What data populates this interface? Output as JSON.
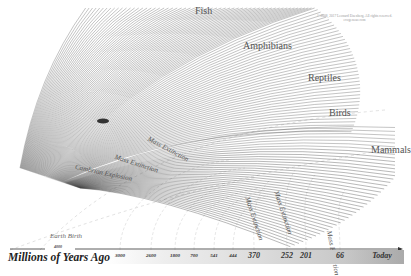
{
  "diagram": {
    "type": "evolutionary-tree-fan",
    "groups": [
      {
        "label": "Fish",
        "x": 195,
        "y": 5
      },
      {
        "label": "Amphibians",
        "x": 243,
        "y": 40
      },
      {
        "label": "Reptiles",
        "x": 308,
        "y": 72
      },
      {
        "label": "Birds",
        "x": 329,
        "y": 107
      },
      {
        "label": "Mammals",
        "x": 371,
        "y": 144
      }
    ],
    "annotations": [
      {
        "label": "Mass Extinction",
        "x": 150,
        "y": 135,
        "rot": 28
      },
      {
        "label": "Mass Extinction",
        "x": 116,
        "y": 153,
        "rot": 18
      },
      {
        "label": "Cambrian Explosion",
        "x": 76,
        "y": 163,
        "rot": 12
      },
      {
        "label": "Mass Extinction",
        "x": 251,
        "y": 196,
        "rot": 72
      },
      {
        "label": "Mass Extinction",
        "x": 280,
        "y": 190,
        "rot": 72
      },
      {
        "label": "Mass Extinction",
        "x": 333,
        "y": 230,
        "rot": 80
      }
    ],
    "earth_birth": "Earth Birth",
    "copyright": "© 2008, 2017 Leonard Eisenberg. All rights reserved. evogeneao.com"
  },
  "axis": {
    "title": "Millions of Years Ago",
    "start_label": "4000",
    "ticks": [
      {
        "label": "3000",
        "x": 120,
        "big": false
      },
      {
        "label": "2600",
        "x": 151,
        "big": false
      },
      {
        "label": "1800",
        "x": 175,
        "big": false
      },
      {
        "label": "700",
        "x": 194,
        "big": false
      },
      {
        "label": "541",
        "x": 214,
        "big": false
      },
      {
        "label": "444",
        "x": 233,
        "big": false
      },
      {
        "label": "370",
        "x": 254,
        "big": true
      },
      {
        "label": "252",
        "x": 287,
        "big": true
      },
      {
        "label": "201",
        "x": 306,
        "big": true
      },
      {
        "label": "66",
        "x": 340,
        "big": true
      },
      {
        "label": "Today",
        "x": 382,
        "big": true
      }
    ]
  }
}
